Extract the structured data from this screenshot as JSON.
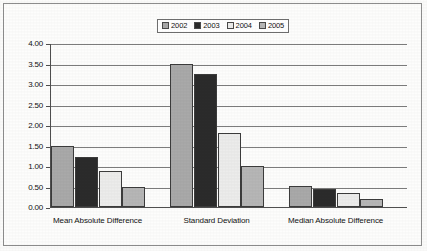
{
  "chart_data": {
    "type": "bar",
    "title": "",
    "xlabel": "",
    "ylabel": "",
    "categories": [
      "Mean Absolute Difference",
      "Standard Deviation",
      "Median  Absolute Difference"
    ],
    "series": [
      {
        "name": "2002",
        "values": [
          1.49,
          3.49,
          0.52
        ],
        "color": "#a9a9a9"
      },
      {
        "name": "2003",
        "values": [
          1.21,
          3.25,
          0.44
        ],
        "color": "#2b2b2b"
      },
      {
        "name": "2004",
        "values": [
          0.87,
          1.8,
          0.35
        ],
        "color": "#ececeb"
      },
      {
        "name": "2005",
        "values": [
          0.48,
          1.01,
          0.19
        ],
        "color": "#b6b6b6"
      }
    ],
    "ylim": [
      0.0,
      4.0
    ],
    "ytick_step": 0.5,
    "ytick_labels": [
      "4.00",
      "3.50",
      "3.00",
      "2.50",
      "2.00",
      "1.50",
      "1.00",
      "0.50",
      "0.00"
    ],
    "ytick_values": [
      4.0,
      3.5,
      3.0,
      2.5,
      2.0,
      1.5,
      1.0,
      0.5,
      0.0
    ],
    "grid": true,
    "legend_position": "top-center"
  },
  "legend": {
    "entries": [
      {
        "label": "2002"
      },
      {
        "label": "2003"
      },
      {
        "label": "2004"
      },
      {
        "label": "2005"
      }
    ]
  }
}
